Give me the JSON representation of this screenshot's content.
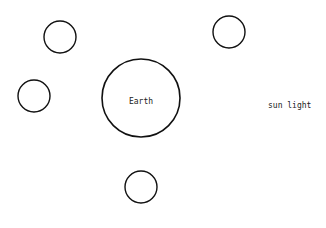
{
  "diagram": {
    "stroke_color": "#111111",
    "background": "#ffffff",
    "earth": {
      "label": "Earth",
      "cx": 141,
      "cy": 98,
      "r": 39
    },
    "satellites": [
      {
        "cx": 60,
        "cy": 37,
        "r": 16
      },
      {
        "cx": 229,
        "cy": 32,
        "r": 16
      },
      {
        "cx": 34,
        "cy": 96,
        "r": 16
      },
      {
        "cx": 141,
        "cy": 187,
        "r": 16
      }
    ],
    "sunlight_label": "sun light"
  }
}
